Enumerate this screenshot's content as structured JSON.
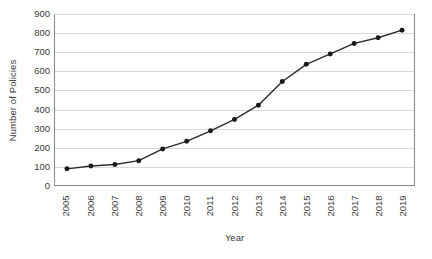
{
  "chart_data": {
    "type": "line",
    "title": "",
    "xlabel": "Year",
    "ylabel": "Number of Policies",
    "categories": [
      "2005",
      "2006",
      "2007",
      "2008",
      "2009",
      "2010",
      "2011",
      "2012",
      "2013",
      "2014",
      "2015",
      "2016",
      "2017",
      "2018",
      "2019"
    ],
    "values": [
      85,
      100,
      108,
      128,
      190,
      230,
      285,
      345,
      420,
      545,
      635,
      690,
      745,
      775,
      815
    ],
    "series": [
      {
        "name": "Number of Policies",
        "values": [
          85,
          100,
          108,
          128,
          190,
          230,
          285,
          345,
          420,
          545,
          635,
          690,
          745,
          775,
          815
        ]
      }
    ],
    "ylim": [
      0,
      900
    ],
    "yticks": [
      0,
      100,
      200,
      300,
      400,
      500,
      600,
      700,
      800,
      900
    ],
    "ytick_labels": [
      "0",
      "100",
      "200",
      "300",
      "400",
      "500",
      "600",
      "700",
      "800",
      "900"
    ],
    "grid": "horizontal",
    "legend": "none",
    "marker": "circle",
    "line_color": "#2b2b2b",
    "marker_color": "#1a1a1a",
    "grid_color": "#d9d9d9",
    "axis_color": "#8a8a8a",
    "background": "#ffffff",
    "xtick_rotation": -90
  }
}
